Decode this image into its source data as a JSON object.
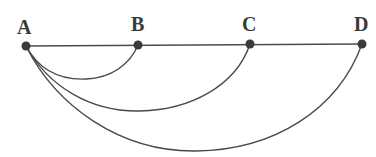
{
  "diagram": {
    "nodes": [
      {
        "id": "A",
        "label": "A",
        "x": 26,
        "y": 46
      },
      {
        "id": "B",
        "label": "B",
        "x": 138,
        "y": 45
      },
      {
        "id": "C",
        "label": "C",
        "x": 250,
        "y": 44
      },
      {
        "id": "D",
        "label": "D",
        "x": 362,
        "y": 44
      }
    ],
    "straight_edges": [
      {
        "from": "A",
        "to": "D",
        "type": "line"
      }
    ],
    "arc_edges": [
      {
        "from": "A",
        "to": "B",
        "type": "arc"
      },
      {
        "from": "A",
        "to": "C",
        "type": "arc"
      },
      {
        "from": "A",
        "to": "D",
        "type": "arc"
      }
    ],
    "colors": {
      "stroke": "#4a4a4a",
      "node": "#3a3a3a",
      "background": "#ffffff"
    }
  }
}
